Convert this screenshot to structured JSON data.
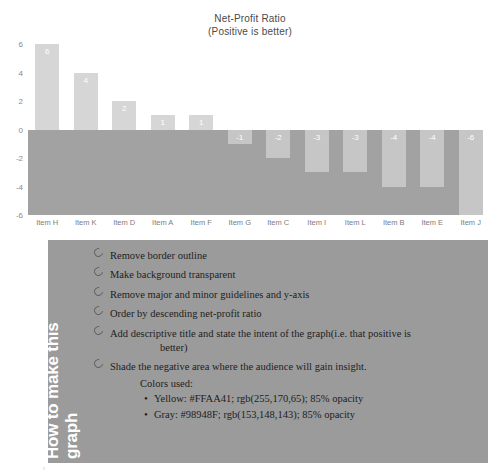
{
  "chart_data": {
    "type": "bar",
    "title": "Net-Profit Ratio",
    "subtitle": "(Positive is better)",
    "xlabel": "",
    "ylabel": "",
    "ylim": [
      -6,
      6
    ],
    "yticks": [
      6,
      4,
      2,
      0,
      -2,
      -4,
      -6
    ],
    "grid": false,
    "legend": "none",
    "categories": [
      "Item H",
      "Item K",
      "Item D",
      "Item A",
      "Item F",
      "Item G",
      "Item C",
      "Item I",
      "Item L",
      "Item B",
      "Item E",
      "Item J"
    ],
    "values": [
      6,
      4,
      2,
      1,
      1,
      -1,
      -2,
      -3,
      -3,
      -4,
      -4,
      -6
    ],
    "data_labels": [
      "6",
      "4",
      "2",
      "1",
      "1",
      "-1",
      "-2",
      "-3",
      "-3",
      "-4",
      "-4",
      "-6"
    ],
    "shaded_region": {
      "label": "negative area shading",
      "from": 0,
      "to": -6
    }
  },
  "notes": {
    "side_title_line1": "How to make this",
    "side_title_line2": "graph",
    "bullets": [
      "Remove border outline",
      "Make background transparent",
      "Remove major and minor guidelines and y-axis",
      "Order by descending net-profit ratio",
      "Add descriptive title and state the intent of the graph(i.e. that positive is",
      "Shade the negative area where the audience will gain insight."
    ],
    "bullet5_continuation": "better)",
    "colors_heading": "Colors used:",
    "color_items": [
      "Yellow: #FFAA41; rgb(255,170,65); 85% opacity",
      "Gray: #98948F; rgb(153,148,143); 85% opacity"
    ],
    "bullet_glyph": "ring-bullet",
    "dot_glyph": "•"
  },
  "palette": {
    "yellow_hex": "#FFAA41",
    "gray_hex": "#98948F",
    "panel_bg": "#9B9B9B",
    "shade_gray": "#A2A2A2",
    "bar_gray": "#D6D6D6"
  },
  "artifact": {
    "mark": "r"
  }
}
